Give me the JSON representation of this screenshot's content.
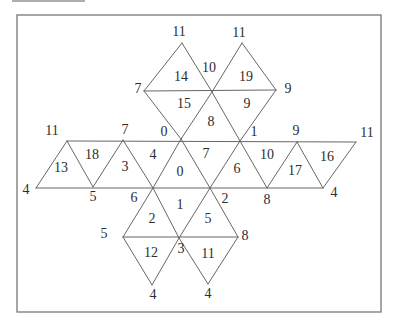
{
  "diagram": {
    "kind": "icosahedron-net",
    "background": "#ffffff",
    "line_color": "#676767",
    "line_width": 1,
    "text_color": "#2d2d2d",
    "font_size": 14,
    "border": {
      "x": 17,
      "y": 15,
      "w": 364,
      "h": 297,
      "color": "#808080",
      "width": 1.4
    },
    "scan_artifact": {
      "x1": 12,
      "y1": 1,
      "x2": 85,
      "y2": 1,
      "color": "#aeaeae",
      "width": 2.2
    },
    "edges": [
      [
        67,
        141,
        356,
        142
      ],
      [
        36,
        188,
        323,
        188
      ],
      [
        144,
        91,
        276,
        90
      ],
      [
        123,
        237,
        238,
        237
      ],
      [
        36,
        188,
        67,
        141
      ],
      [
        67,
        141,
        93,
        187
      ],
      [
        93,
        187,
        123,
        140
      ],
      [
        123,
        140,
        153,
        188
      ],
      [
        153,
        188,
        181,
        139
      ],
      [
        181,
        139,
        210,
        188
      ],
      [
        210,
        188,
        240,
        141
      ],
      [
        240,
        141,
        267,
        188
      ],
      [
        267,
        188,
        297,
        142
      ],
      [
        297,
        142,
        323,
        188
      ],
      [
        323,
        188,
        356,
        142
      ],
      [
        181,
        139,
        144,
        91
      ],
      [
        144,
        91,
        182,
        43
      ],
      [
        182,
        43,
        212,
        92
      ],
      [
        212,
        92,
        242,
        43
      ],
      [
        242,
        43,
        276,
        90
      ],
      [
        212,
        92,
        181,
        139
      ],
      [
        212,
        92,
        240,
        141
      ],
      [
        276,
        90,
        240,
        141
      ],
      [
        153,
        188,
        123,
        237
      ],
      [
        153,
        188,
        179,
        238
      ],
      [
        210,
        188,
        179,
        238
      ],
      [
        210,
        188,
        238,
        237
      ],
      [
        123,
        237,
        152,
        285
      ],
      [
        179,
        238,
        152,
        285
      ],
      [
        179,
        238,
        208,
        284
      ],
      [
        238,
        237,
        208,
        284
      ]
    ],
    "vertex_labels": [
      {
        "t": "11",
        "x": 52,
        "y": 130
      },
      {
        "t": "7",
        "x": 125,
        "y": 129
      },
      {
        "t": "0",
        "x": 164,
        "y": 131
      },
      {
        "t": "1",
        "x": 254,
        "y": 131
      },
      {
        "t": "9",
        "x": 296,
        "y": 130
      },
      {
        "t": "11",
        "x": 367,
        "y": 132
      },
      {
        "t": "4",
        "x": 26,
        "y": 189
      },
      {
        "t": "5",
        "x": 93,
        "y": 196
      },
      {
        "t": "6",
        "x": 134,
        "y": 197
      },
      {
        "t": "2",
        "x": 225,
        "y": 198
      },
      {
        "t": "8",
        "x": 267,
        "y": 199
      },
      {
        "t": "4",
        "x": 334,
        "y": 192
      },
      {
        "t": "11",
        "x": 179,
        "y": 31
      },
      {
        "t": "11",
        "x": 239,
        "y": 32
      },
      {
        "t": "7",
        "x": 138,
        "y": 88
      },
      {
        "t": "10",
        "x": 209,
        "y": 67
      },
      {
        "t": "9",
        "x": 288,
        "y": 88
      },
      {
        "t": "5",
        "x": 104,
        "y": 233
      },
      {
        "t": "3",
        "x": 181,
        "y": 248
      },
      {
        "t": "8",
        "x": 245,
        "y": 235
      },
      {
        "t": "4",
        "x": 153,
        "y": 294
      },
      {
        "t": "4",
        "x": 208,
        "y": 293
      }
    ],
    "face_labels": [
      {
        "t": "14",
        "x": 181,
        "y": 76
      },
      {
        "t": "19",
        "x": 246,
        "y": 76
      },
      {
        "t": "15",
        "x": 184,
        "y": 103
      },
      {
        "t": "9",
        "x": 247,
        "y": 103
      },
      {
        "t": "8",
        "x": 211,
        "y": 121
      },
      {
        "t": "13",
        "x": 61,
        "y": 167
      },
      {
        "t": "18",
        "x": 92,
        "y": 154
      },
      {
        "t": "3",
        "x": 125,
        "y": 166
      },
      {
        "t": "4",
        "x": 153,
        "y": 154
      },
      {
        "t": "0",
        "x": 180,
        "y": 171
      },
      {
        "t": "7",
        "x": 206,
        "y": 153
      },
      {
        "t": "6",
        "x": 237,
        "y": 168
      },
      {
        "t": "10",
        "x": 267,
        "y": 154
      },
      {
        "t": "17",
        "x": 295,
        "y": 170
      },
      {
        "t": "16",
        "x": 327,
        "y": 156
      },
      {
        "t": "1",
        "x": 180,
        "y": 204
      },
      {
        "t": "2",
        "x": 152,
        "y": 218
      },
      {
        "t": "5",
        "x": 208,
        "y": 218
      },
      {
        "t": "12",
        "x": 151,
        "y": 252
      },
      {
        "t": "11",
        "x": 208,
        "y": 253
      }
    ]
  }
}
